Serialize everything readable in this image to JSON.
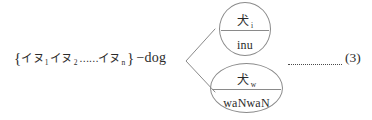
{
  "figure": {
    "equation_number": "(3)",
    "leader_dots": "·············"
  },
  "set_expression": {
    "open_brace": "{",
    "close_brace": "}",
    "items": [
      {
        "word": "イヌ",
        "subscript": "1"
      },
      {
        "word": "イヌ",
        "subscript": "2"
      },
      {
        "word": "イヌ",
        "subscript": "n"
      }
    ],
    "ellipsis": "……",
    "gloss": "−dog",
    "full_text": "{イヌ1 イヌ2 ……イヌn} −dog"
  },
  "nodes": [
    {
      "id": "inu",
      "kanji": "犬",
      "subscript": "i",
      "romaji": "inu",
      "shape": "circle"
    },
    {
      "id": "wanwan",
      "kanji": "犬",
      "subscript": "w",
      "romaji": "waNwaN",
      "shape": "ellipse"
    }
  ],
  "colors": {
    "ink": "#2b2b2b",
    "stroke": "#8a8a8a",
    "background": "#ffffff"
  }
}
